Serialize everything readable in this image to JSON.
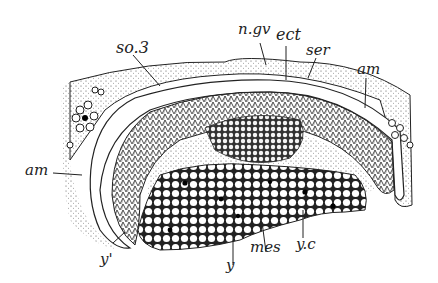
{
  "figure": {
    "type": "embryo cross-section illustration",
    "labels": {
      "so3": "so.3",
      "ngv": "n.gv",
      "ect": "ect",
      "ser": "ser",
      "am_right": "am",
      "am_left": "am",
      "y_prime": "y'",
      "y": "y",
      "mes": "mes",
      "yc": "y.c"
    },
    "colors": {
      "ink": "#1a1a1a",
      "background": "#ffffff"
    }
  }
}
